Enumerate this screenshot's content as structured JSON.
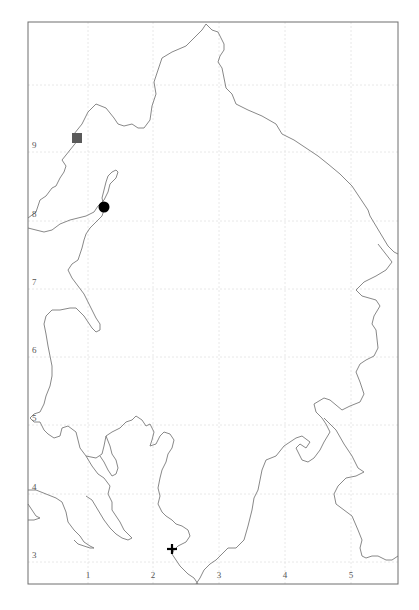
{
  "map": {
    "frame": {
      "x1": 28,
      "y1": 22,
      "x2": 398,
      "y2": 584
    },
    "x_axis": {
      "ticks": [
        {
          "label": "1",
          "x": 88
        },
        {
          "label": "2",
          "x": 153
        },
        {
          "label": "3",
          "x": 219
        },
        {
          "label": "4",
          "x": 285
        },
        {
          "label": "5",
          "x": 351
        }
      ]
    },
    "y_axis": {
      "ticks": [
        {
          "label": "3",
          "y": 562
        },
        {
          "label": "4",
          "y": 494
        },
        {
          "label": "5",
          "y": 425
        },
        {
          "label": "6",
          "y": 357
        },
        {
          "label": "7",
          "y": 289
        },
        {
          "label": "8",
          "y": 221
        },
        {
          "label": "9",
          "y": 152
        },
        {
          "label": "",
          "y": 85
        }
      ]
    },
    "markers": [
      {
        "name": "square-marker",
        "shape": "square",
        "x": 77,
        "y": 138,
        "color": "#5a5a5a"
      },
      {
        "name": "circle-marker",
        "shape": "circle",
        "x": 104,
        "y": 207,
        "color": "#000000"
      },
      {
        "name": "cross-marker",
        "shape": "cross",
        "x": 172,
        "y": 549,
        "color": "#000000"
      }
    ],
    "colors": {
      "frame": "#6e6e6e",
      "coastline": "#7a7a7a",
      "grid": "#e2e2e2"
    }
  }
}
